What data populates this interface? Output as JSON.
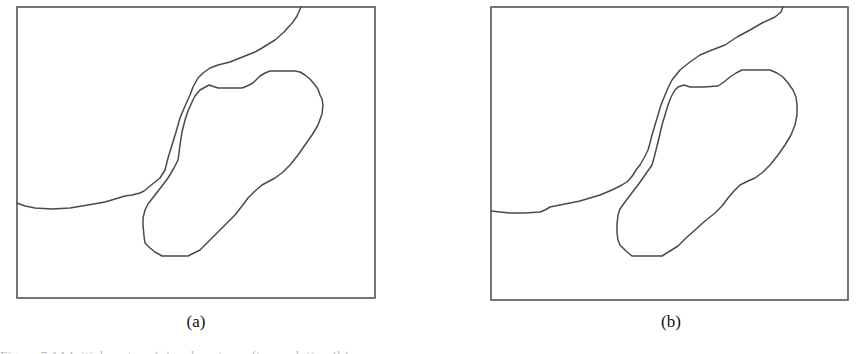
{
  "figure": {
    "panels": [
      {
        "id": "a",
        "label": "(a)",
        "frame": {
          "x": 17,
          "y": 7,
          "w": 358,
          "h": 291
        },
        "curves": {
          "outer_boundary": "M301,7 L297,16 L293,22 L284,32 L275,40 L262,48 L255,52 L240,58 L230,62 L218,65 L210,68 L203,73 L198,78 L193,87 L190,95 L185,106 L180,118 L176,132 L172,145 L168,158 L165,170 L160,178 L150,186 L144,191 L140,193 L132,195 L125,196 L115,199 L105,202 L88,205 L70,208 L52,209 L35,208 L25,206 L17,203",
          "inner_region": "M209,85 L200,90 L195,96 L192,102 L188,111 L185,120 L182,132 L180,145 L179,153 L178,160 L174,168 L168,178 L162,186 L155,195 L148,204 L145,210 L143,218 L143,225 L144,236 L145,243 L150,248 L155,252 L162,256 L175,256 L188,256 L200,250 L207,243 L215,235 L225,225 L235,215 L242,206 L248,198 L255,191 L262,185 L275,178 L283,172 L290,165 L298,155 L305,145 L312,135 L318,125 L322,114 L323,105 L322,99 L320,95 L318,89 L315,85 L310,79 L305,75 L300,72 L295,71 L282,71 L270,71 L265,73 L260,76 L256,80 L253,83 L247,86 L242,88 L230,88 L218,88 L212,86 Z"
        }
      },
      {
        "id": "b",
        "label": "(b)",
        "frame": {
          "x": 491,
          "y": 7,
          "w": 357,
          "h": 293
        },
        "curves": {
          "outer_boundary": "M783,7 L781,12 L775,17 L762,23 L750,30 L737,37 L725,45 L712,50 L700,55 L690,62 L680,70 L676,75 L672,80 L668,88 L665,95 L661,105 L658,115 L655,125 L652,135 L650,143 L648,150 L644,158 L640,165 L636,170 L633,175 L628,181 L622,185 L612,190 L600,195 L590,198 L580,201 L565,204 L550,207 L545,210 L540,212 L525,213 L510,213 L500,212 L491,211",
          "inner_region": "M684,85 L678,87 L675,90 L671,97 L668,105 L665,115 L662,125 L659,138 L656,150 L654,158 L652,165 L645,175 L638,185 L631,194 L625,202 L620,209 L618,215 L617,224 L617,233 L618,240 L620,245 L626,251 L632,256 L647,256 L662,256 L670,251 L678,246 L686,238 L695,230 L705,221 L715,213 L722,206 L728,198 L734,191 L740,185 L748,181 L755,178 L763,172 L770,165 L778,155 L785,145 L791,135 L795,125 L797,115 L797,105 L796,97 L793,90 L788,83 L783,77 L777,73 L770,70 L756,70 L742,70 L736,73 L730,77 L724,82 L718,86 L704,87 L690,87 Z"
        }
      }
    ],
    "caption_partial": "Figure 7.14 Initial contour (a) and contour after evolution (b) ..."
  },
  "colors": {
    "background": "#ffffff",
    "line": "#4a4a4a",
    "frame": "#555555"
  }
}
